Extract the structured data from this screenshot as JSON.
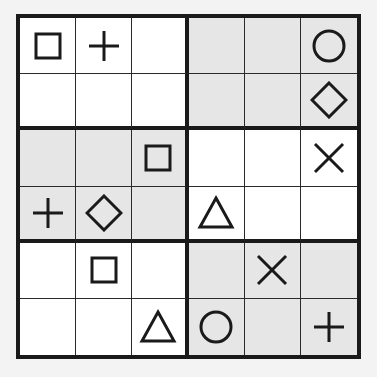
{
  "puzzle": {
    "type": "6x6 symbol sudoku",
    "rows": 6,
    "cols": 6,
    "box_rows": 2,
    "box_cols": 3,
    "shaded_color": "#e6e6e6",
    "line_color": "#1a1a1a",
    "cells": [
      [
        "square",
        "plus",
        "",
        "",
        "",
        "circle"
      ],
      [
        "",
        "",
        "",
        "",
        "",
        "diamond"
      ],
      [
        "",
        "",
        "square",
        "",
        "",
        "cross"
      ],
      [
        "plus",
        "diamond",
        "",
        "triangle",
        "",
        ""
      ],
      [
        "",
        "square",
        "",
        "",
        "cross",
        ""
      ],
      [
        "",
        "",
        "triangle",
        "circle",
        "",
        "plus"
      ]
    ],
    "shaded": [
      [
        false,
        false,
        false,
        true,
        true,
        true
      ],
      [
        false,
        false,
        false,
        true,
        true,
        true
      ],
      [
        true,
        true,
        true,
        false,
        false,
        false
      ],
      [
        true,
        true,
        true,
        false,
        false,
        false
      ],
      [
        false,
        false,
        false,
        true,
        true,
        true
      ],
      [
        false,
        false,
        false,
        true,
        true,
        true
      ]
    ]
  }
}
